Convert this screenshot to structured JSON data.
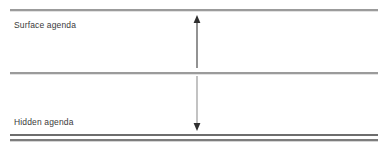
{
  "diagram": {
    "background_color": "#ffffff",
    "line_color": "#9b9b9b",
    "baseline_color": "#6d6d6d",
    "text_color": "#3a3a3a",
    "arrow_color": "#4a4a4a",
    "bands": [
      {
        "id": "surface",
        "label": "Surface agenda",
        "arrow": "arrow-up"
      },
      {
        "id": "hidden",
        "label": "Hidden agenda",
        "arrow": "arrow-down"
      }
    ],
    "rules": {
      "top": "horizontal-rule-top",
      "middle": "horizontal-rule-middle",
      "bottom_1": "horizontal-rule-bottom-upper",
      "bottom_2": "horizontal-rule-bottom-lower"
    }
  }
}
